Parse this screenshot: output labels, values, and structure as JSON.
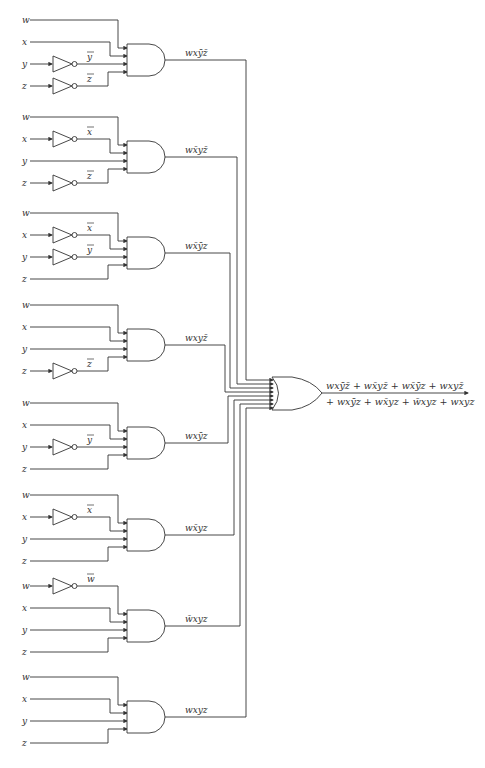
{
  "diagram": {
    "blocks": [
      {
        "inputs": [
          {
            "label": "w",
            "inverted": false
          },
          {
            "label": "x",
            "inverted": false
          },
          {
            "label": "y",
            "inverted": true,
            "inv_label": "y"
          },
          {
            "label": "z",
            "inverted": true,
            "inv_label": "z"
          }
        ],
        "output_label": "wxȳz̄"
      },
      {
        "inputs": [
          {
            "label": "w",
            "inverted": false
          },
          {
            "label": "x",
            "inverted": true,
            "inv_label": "x"
          },
          {
            "label": "y",
            "inverted": false
          },
          {
            "label": "z",
            "inverted": true,
            "inv_label": "z"
          }
        ],
        "output_label": "wx̄yz̄"
      },
      {
        "inputs": [
          {
            "label": "w",
            "inverted": false
          },
          {
            "label": "x",
            "inverted": true,
            "inv_label": "x"
          },
          {
            "label": "y",
            "inverted": true,
            "inv_label": "y"
          },
          {
            "label": "z",
            "inverted": false
          }
        ],
        "output_label": "wx̄ȳz"
      },
      {
        "inputs": [
          {
            "label": "w",
            "inverted": false
          },
          {
            "label": "x",
            "inverted": false
          },
          {
            "label": "y",
            "inverted": false
          },
          {
            "label": "z",
            "inverted": true,
            "inv_label": "z"
          }
        ],
        "output_label": "wxyz̄"
      },
      {
        "inputs": [
          {
            "label": "w",
            "inverted": false
          },
          {
            "label": "x",
            "inverted": false
          },
          {
            "label": "y",
            "inverted": true,
            "inv_label": "y"
          },
          {
            "label": "z",
            "inverted": false
          }
        ],
        "output_label": "wxȳz"
      },
      {
        "inputs": [
          {
            "label": "w",
            "inverted": false
          },
          {
            "label": "x",
            "inverted": true,
            "inv_label": "x"
          },
          {
            "label": "y",
            "inverted": false
          },
          {
            "label": "z",
            "inverted": false
          }
        ],
        "output_label": "wx̄yz"
      },
      {
        "inputs": [
          {
            "label": "w",
            "inverted": true,
            "inv_label": "w"
          },
          {
            "label": "x",
            "inverted": false
          },
          {
            "label": "y",
            "inverted": false
          },
          {
            "label": "z",
            "inverted": false
          }
        ],
        "output_label": "w̄xyz"
      },
      {
        "inputs": [
          {
            "label": "w",
            "inverted": false
          },
          {
            "label": "x",
            "inverted": false
          },
          {
            "label": "y",
            "inverted": false
          },
          {
            "label": "z",
            "inverted": false
          }
        ],
        "output_label": "wxyz"
      }
    ],
    "or_gate": {
      "output_line1": "wxȳz̄ + wx̄yz̄ + wx̄ȳz + wxyz̄",
      "output_line2": "+ wxȳz + wx̄yz + w̄xyz + wxyz"
    }
  }
}
